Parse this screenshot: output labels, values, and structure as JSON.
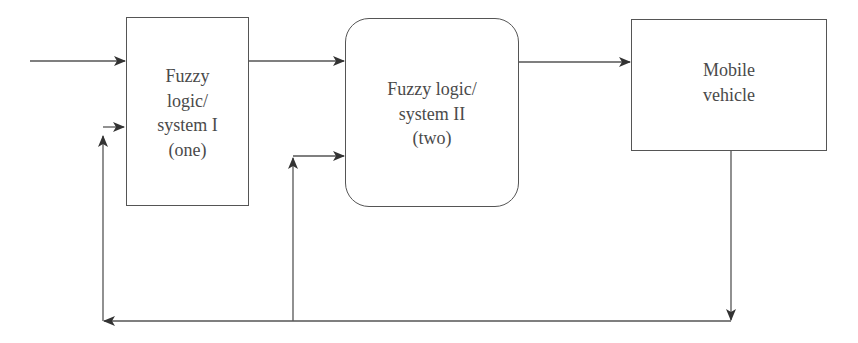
{
  "diagram": {
    "blocks": [
      {
        "id": "fls1",
        "lines": [
          "Fuzzy",
          "logic/",
          "system I",
          "(one)"
        ]
      },
      {
        "id": "fls2",
        "lines": [
          "Fuzzy logic/",
          "system II",
          "(two)"
        ]
      },
      {
        "id": "vehicle",
        "lines": [
          "Mobile",
          "vehicle"
        ]
      }
    ],
    "connections": [
      {
        "from": "input",
        "to": "fls1"
      },
      {
        "from": "fls1",
        "to": "fls2"
      },
      {
        "from": "fls2",
        "to": "vehicle"
      },
      {
        "from": "vehicle",
        "to": "feedback-bus"
      },
      {
        "from": "feedback-bus",
        "to": "fls1"
      },
      {
        "from": "feedback-bus",
        "to": "fls2"
      }
    ],
    "colors": {
      "line": "#444444",
      "text": "#4a4a4a",
      "background": "#ffffff"
    }
  }
}
